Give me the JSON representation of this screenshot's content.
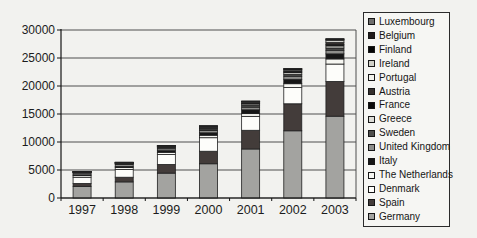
{
  "page": {
    "background": "#f2f2ef"
  },
  "chart_data": {
    "type": "bar",
    "subtype": "stacked",
    "title": "",
    "xlabel": "",
    "ylabel": "",
    "categories": [
      "1997",
      "1998",
      "1999",
      "2000",
      "2001",
      "2002",
      "2003"
    ],
    "y_tick_labels": [
      "0",
      "5000",
      "10000",
      "15000",
      "20000",
      "25000",
      "30000"
    ],
    "ylim": [
      0,
      30000
    ],
    "grid": true,
    "legend_position": "right",
    "legend_order": "top-to-bottom reverse of stacking (Luxembourg first, Germany bottom segment)",
    "series": [
      {
        "name": "Germany",
        "color": "#a3a3a0",
        "values": [
          2081,
          2875,
          4442,
          6113,
          8754,
          12001,
          14609
        ]
      },
      {
        "name": "Spain",
        "color": "#433c3a",
        "values": [
          512,
          834,
          1542,
          2235,
          3337,
          4825,
          6202
        ]
      },
      {
        "name": "Denmark",
        "color": "#fdfdfa",
        "values": [
          1116,
          1383,
          1771,
          2417,
          2489,
          2889,
          3110
        ]
      },
      {
        "name": "The Netherlands",
        "color": "#f7f7f2",
        "values": [
          319,
          361,
          411,
          446,
          486,
          693,
          912
        ]
      },
      {
        "name": "Italy",
        "color": "#161616",
        "values": [
          103,
          180,
          283,
          427,
          682,
          785,
          904
        ]
      },
      {
        "name": "United Kingdom",
        "color": "#8e8e8b",
        "values": [
          319,
          333,
          344,
          406,
          474,
          552,
          649
        ]
      },
      {
        "name": "Sweden",
        "color": "#4e4e4c",
        "values": [
          122,
          174,
          215,
          231,
          290,
          345,
          399
        ]
      },
      {
        "name": "Greece",
        "color": "#dcdcd6",
        "values": [
          29,
          39,
          121,
          189,
          272,
          297,
          375
        ]
      },
      {
        "name": "France",
        "color": "#0b0b0b",
        "values": [
          13,
          19,
          25,
          66,
          93,
          148,
          239
        ]
      },
      {
        "name": "Austria",
        "color": "#35302e",
        "values": [
          20,
          30,
          34,
          77,
          94,
          139,
          415
        ]
      },
      {
        "name": "Portugal",
        "color": "#f2f2ec",
        "values": [
          39,
          60,
          61,
          100,
          125,
          194,
          299
        ]
      },
      {
        "name": "Ireland",
        "color": "#d0d0c8",
        "values": [
          53,
          63,
          73,
          118,
          124,
          137,
          186
        ]
      },
      {
        "name": "Finland",
        "color": "#040404",
        "values": [
          12,
          17,
          38,
          38,
          39,
          41,
          51
        ]
      },
      {
        "name": "Belgium",
        "color": "#211c1c",
        "values": [
          4,
          6,
          6,
          13,
          31,
          44,
          68
        ]
      },
      {
        "name": "Luxembourg",
        "color": "#6f6f6d",
        "values": [
          2,
          9,
          10,
          10,
          15,
          17,
          22
        ]
      }
    ],
    "layout": {
      "plot_left": 61,
      "plot_right": 356,
      "plot_top": 30,
      "plot_bottom": 198,
      "bar_width": 18,
      "gridline_color": "#4f4f4f",
      "axis_color": "#141414",
      "segment_border_color": "#1f1f1f",
      "tick_label_color": "#1c1c1c"
    }
  }
}
